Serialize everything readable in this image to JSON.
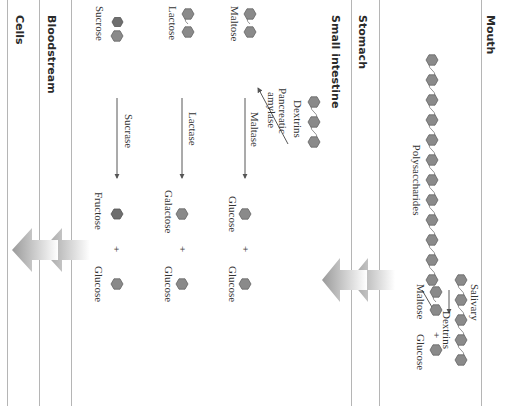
{
  "sections": [
    {
      "id": "mouth",
      "label": "Mouth"
    },
    {
      "id": "stomach",
      "label": "Stomach"
    },
    {
      "id": "small_intestine",
      "label": "Small intestine"
    },
    {
      "id": "bloodstream",
      "label": "Bloodstream"
    },
    {
      "id": "cells",
      "label": "Cells"
    }
  ],
  "mouth": {
    "substrate": "Polysaccharides",
    "enzyme": "Salivary amylase",
    "enzyme_lines": [
      "Salivary",
      "amylase"
    ],
    "products": {
      "chain": "Dextrins",
      "left": "Maltose",
      "plus": "+",
      "right": "Glucose"
    }
  },
  "small_intestine": {
    "pancreatic_enzyme_lines": [
      "Pancreatic",
      "amylase"
    ],
    "dextrins_label": "Dextrins",
    "reactions": [
      {
        "substrate": "Maltose",
        "enzyme": "Maltase",
        "product_a": "Glucose",
        "plus": "+",
        "product_b": "Glucose"
      },
      {
        "substrate": "Lactose",
        "enzyme": "Lactase",
        "product_a": "Galactose",
        "plus": "+",
        "product_b": "Glucose"
      },
      {
        "substrate": "Sucrose",
        "enzyme": "Sucrase",
        "product_a": "Fructose",
        "plus": "+",
        "product_b": "Glucose"
      }
    ]
  },
  "colors": {
    "sugar_fill": "#8a8a8a",
    "sugar_dark": "#6e6e6e",
    "divider": "#b5b5b5",
    "arrow_gradient": [
      "#9a9a9a",
      "#ffffff"
    ]
  }
}
